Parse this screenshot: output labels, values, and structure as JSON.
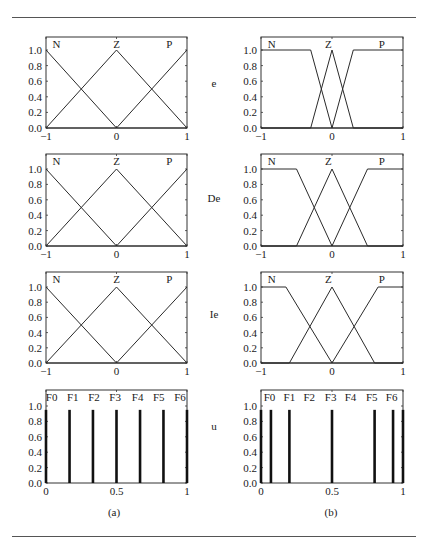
{
  "figure": {
    "panel_labels": [
      "(a)",
      "(b)"
    ],
    "row_labels": [
      "e",
      "De",
      "Ie",
      "u"
    ]
  },
  "chart_data": [
    {
      "type": "line",
      "panel": "(a)",
      "row_label": "e",
      "xlim": [
        -1,
        1
      ],
      "ylim": [
        0,
        1
      ],
      "xticks": [
        -1,
        0,
        1
      ],
      "xtick_labels": [
        "−1",
        "0",
        "1"
      ],
      "yticks": [
        0,
        0.2,
        0.4,
        0.6,
        0.8,
        1.0
      ],
      "ytick_labels": [
        "0.0",
        "0.2",
        "0.4",
        "0.6",
        "0.8",
        "1.0"
      ],
      "series": [
        {
          "name": "N",
          "x": [
            -1,
            0,
            1
          ],
          "y": [
            1,
            0,
            0
          ]
        },
        {
          "name": "Z",
          "x": [
            -1,
            0,
            1
          ],
          "y": [
            0,
            1,
            0
          ]
        },
        {
          "name": "P",
          "x": [
            -1,
            0,
            1
          ],
          "y": [
            0,
            0,
            1
          ]
        }
      ],
      "labels": [
        {
          "text": "N",
          "x": -0.85
        },
        {
          "text": "Z",
          "x": 0
        },
        {
          "text": "P",
          "x": 0.75
        }
      ]
    },
    {
      "type": "line",
      "panel": "(b)",
      "row_label": "e",
      "xlim": [
        -1,
        1
      ],
      "ylim": [
        0,
        1
      ],
      "xticks": [
        -1,
        0,
        1
      ],
      "xtick_labels": [
        "−1",
        "0",
        "1"
      ],
      "yticks": [
        0,
        0.2,
        0.4,
        0.6,
        0.8,
        1.0
      ],
      "ytick_labels": [
        "0.0",
        "0.2",
        "0.4",
        "0.6",
        "0.8",
        "1.0"
      ],
      "series": [
        {
          "name": "N",
          "x": [
            -1,
            -0.3,
            0,
            1
          ],
          "y": [
            1,
            1,
            0,
            0
          ]
        },
        {
          "name": "Z",
          "x": [
            -1,
            -0.3,
            0,
            0.3,
            1
          ],
          "y": [
            0,
            0,
            1,
            0,
            0
          ]
        },
        {
          "name": "P",
          "x": [
            -1,
            0,
            0.3,
            1
          ],
          "y": [
            0,
            0,
            1,
            1
          ]
        }
      ],
      "labels": [
        {
          "text": "N",
          "x": -0.85
        },
        {
          "text": "Z",
          "x": -0.05
        },
        {
          "text": "P",
          "x": 0.7
        }
      ]
    },
    {
      "type": "line",
      "panel": "(a)",
      "row_label": "De",
      "xlim": [
        -1,
        1
      ],
      "ylim": [
        0,
        1
      ],
      "xticks": [
        -1,
        0,
        1
      ],
      "xtick_labels": [
        "−1",
        "0",
        "1"
      ],
      "yticks": [
        0,
        0.2,
        0.4,
        0.6,
        0.8,
        1.0
      ],
      "ytick_labels": [
        "0.0",
        "0.2",
        "0.4",
        "0.6",
        "0.8",
        "1.0"
      ],
      "series": [
        {
          "name": "N",
          "x": [
            -1,
            0,
            1
          ],
          "y": [
            1,
            0,
            0
          ]
        },
        {
          "name": "Z",
          "x": [
            -1,
            0,
            1
          ],
          "y": [
            0,
            1,
            0
          ]
        },
        {
          "name": "P",
          "x": [
            -1,
            0,
            1
          ],
          "y": [
            0,
            0,
            1
          ]
        }
      ],
      "labels": [
        {
          "text": "N",
          "x": -0.85
        },
        {
          "text": "Z",
          "x": 0
        },
        {
          "text": "P",
          "x": 0.75
        }
      ]
    },
    {
      "type": "line",
      "panel": "(b)",
      "row_label": "De",
      "xlim": [
        -1,
        1
      ],
      "ylim": [
        0,
        1
      ],
      "xticks": [
        -1,
        0,
        1
      ],
      "xtick_labels": [
        "−1",
        "0",
        "1"
      ],
      "yticks": [
        0,
        0.2,
        0.4,
        0.6,
        0.8,
        1.0
      ],
      "ytick_labels": [
        "0.0",
        "0.2",
        "0.4",
        "0.6",
        "0.8",
        "1.0"
      ],
      "series": [
        {
          "name": "N",
          "x": [
            -1,
            -0.5,
            0,
            1
          ],
          "y": [
            1,
            1,
            0,
            0
          ]
        },
        {
          "name": "Z",
          "x": [
            -1,
            -0.5,
            0,
            0.5,
            1
          ],
          "y": [
            0,
            0,
            1,
            0,
            0
          ]
        },
        {
          "name": "P",
          "x": [
            -1,
            0,
            0.5,
            1
          ],
          "y": [
            0,
            0,
            1,
            1
          ]
        }
      ],
      "labels": [
        {
          "text": "N",
          "x": -0.85
        },
        {
          "text": "Z",
          "x": -0.05
        },
        {
          "text": "P",
          "x": 0.7
        }
      ]
    },
    {
      "type": "line",
      "panel": "(a)",
      "row_label": "Ie",
      "xlim": [
        -1,
        1
      ],
      "ylim": [
        0,
        1
      ],
      "xticks": [
        -1,
        0,
        1
      ],
      "xtick_labels": [
        "−1",
        "0",
        "1"
      ],
      "yticks": [
        0,
        0.2,
        0.4,
        0.6,
        0.8,
        1.0
      ],
      "ytick_labels": [
        "0.0",
        "0.2",
        "0.4",
        "0.6",
        "0.8",
        "1.0"
      ],
      "series": [
        {
          "name": "N",
          "x": [
            -1,
            0,
            1
          ],
          "y": [
            1,
            0,
            0
          ]
        },
        {
          "name": "Z",
          "x": [
            -1,
            0,
            1
          ],
          "y": [
            0,
            1,
            0
          ]
        },
        {
          "name": "P",
          "x": [
            -1,
            0,
            1
          ],
          "y": [
            0,
            0,
            1
          ]
        }
      ],
      "labels": [
        {
          "text": "N",
          "x": -0.85
        },
        {
          "text": "Z",
          "x": 0
        },
        {
          "text": "P",
          "x": 0.75
        }
      ]
    },
    {
      "type": "line",
      "panel": "(b)",
      "row_label": "Ie",
      "xlim": [
        -1,
        1
      ],
      "ylim": [
        0,
        1
      ],
      "xticks": [
        -1,
        0,
        1
      ],
      "xtick_labels": [
        "−1",
        "0",
        "1"
      ],
      "yticks": [
        0,
        0.2,
        0.4,
        0.6,
        0.8,
        1.0
      ],
      "ytick_labels": [
        "0.0",
        "0.2",
        "0.4",
        "0.6",
        "0.8",
        "1.0"
      ],
      "series": [
        {
          "name": "N",
          "x": [
            -1,
            -0.65,
            0,
            1
          ],
          "y": [
            1,
            1,
            0,
            0
          ]
        },
        {
          "name": "Z",
          "x": [
            -1,
            -0.6,
            0,
            0.6,
            1
          ],
          "y": [
            0,
            0,
            1,
            0,
            0
          ]
        },
        {
          "name": "P",
          "x": [
            -1,
            0,
            0.65,
            1
          ],
          "y": [
            0,
            0,
            1,
            1
          ]
        }
      ],
      "labels": [
        {
          "text": "N",
          "x": -0.85
        },
        {
          "text": "Z",
          "x": -0.05
        },
        {
          "text": "P",
          "x": 0.7
        }
      ]
    },
    {
      "type": "bar",
      "panel": "(a)",
      "row_label": "u",
      "xlim": [
        0,
        1
      ],
      "ylim": [
        0,
        1
      ],
      "xticks": [
        0,
        0.5,
        1
      ],
      "xtick_labels": [
        "0",
        "0.5",
        "1"
      ],
      "yticks": [
        0,
        0.2,
        0.4,
        0.6,
        0.8,
        1.0
      ],
      "ytick_labels": [
        "0.0",
        "0.2",
        "0.4",
        "0.6",
        "0.8",
        "1.0"
      ],
      "categories": [
        "F0",
        "F1",
        "F2",
        "F3",
        "F4",
        "F5",
        "F6"
      ],
      "x": [
        0,
        0.167,
        0.333,
        0.5,
        0.667,
        0.833,
        1.0
      ],
      "values": [
        0.95,
        0.95,
        0.95,
        0.95,
        0.95,
        0.95,
        0.95
      ],
      "labels": [
        {
          "text": "F0",
          "x": 0.04
        },
        {
          "text": "F1",
          "x": 0.19
        },
        {
          "text": "F2",
          "x": 0.34
        },
        {
          "text": "F3",
          "x": 0.49
        },
        {
          "text": "F4",
          "x": 0.65
        },
        {
          "text": "F5",
          "x": 0.8
        },
        {
          "text": "F6",
          "x": 0.95
        }
      ]
    },
    {
      "type": "bar",
      "panel": "(b)",
      "row_label": "u",
      "xlim": [
        0,
        1
      ],
      "ylim": [
        0,
        1
      ],
      "xticks": [
        0,
        0.5,
        1
      ],
      "xtick_labels": [
        "0",
        "0.5",
        "1"
      ],
      "yticks": [
        0,
        0.2,
        0.4,
        0.6,
        0.8,
        1.0
      ],
      "ytick_labels": [
        "0.0",
        "0.2",
        "0.4",
        "0.6",
        "0.8",
        "1.0"
      ],
      "categories": [
        "F0",
        "F1",
        "F2",
        "F3",
        "F4",
        "F5",
        "F6"
      ],
      "x": [
        0,
        0.07,
        0.2,
        0.5,
        0.8,
        0.93,
        1.0
      ],
      "values": [
        0.95,
        0.95,
        0.95,
        0.95,
        0.95,
        0.95,
        0.95
      ],
      "labels": [
        {
          "text": "F0",
          "x": 0.06
        },
        {
          "text": "F1",
          "x": 0.2
        },
        {
          "text": "F2",
          "x": 0.34
        },
        {
          "text": "F3",
          "x": 0.49
        },
        {
          "text": "F4",
          "x": 0.63
        },
        {
          "text": "F5",
          "x": 0.78
        },
        {
          "text": "F6",
          "x": 0.92
        }
      ]
    }
  ]
}
